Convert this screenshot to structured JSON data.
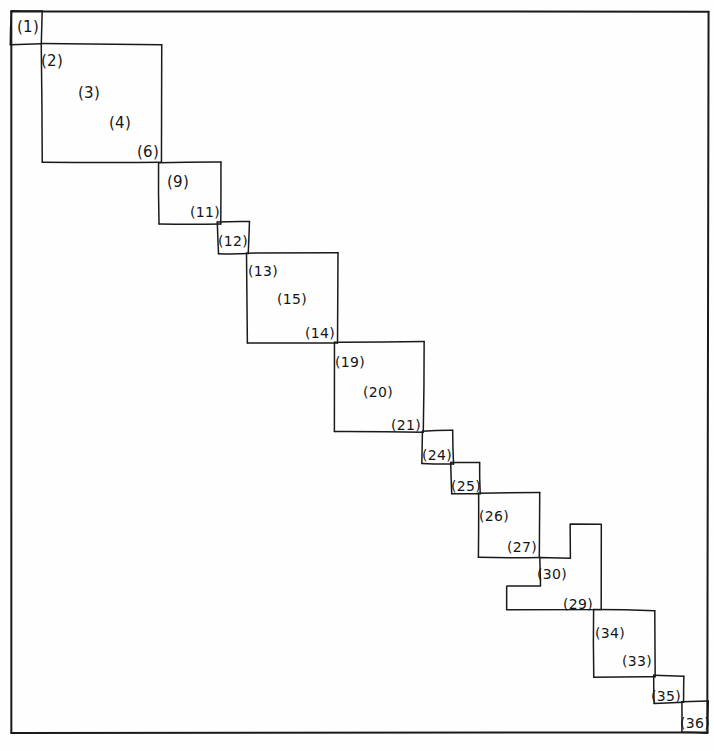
{
  "figure": {
    "stroke_color": "#1a1a1a",
    "background_color": "#fefefe",
    "frame": {
      "x": 11,
      "y": 11,
      "width": 697,
      "height": 722
    },
    "labels": [
      {
        "id": "1",
        "text": "(1)",
        "x": 28,
        "y": 27
      },
      {
        "id": "2",
        "text": "(2)",
        "x": 52,
        "y": 61
      },
      {
        "id": "3",
        "text": "(3)",
        "x": 89,
        "y": 93
      },
      {
        "id": "4",
        "text": "(4)",
        "x": 120,
        "y": 123
      },
      {
        "id": "6",
        "text": "(6)",
        "x": 148,
        "y": 152
      },
      {
        "id": "9",
        "text": "(9)",
        "x": 178,
        "y": 182
      },
      {
        "id": "11",
        "text": "(11)",
        "x": 205,
        "y": 212
      },
      {
        "id": "12",
        "text": "(12)",
        "x": 233,
        "y": 241
      },
      {
        "id": "13",
        "text": "(13)",
        "x": 263,
        "y": 271
      },
      {
        "id": "15",
        "text": "(15)",
        "x": 292,
        "y": 299
      },
      {
        "id": "14",
        "text": "(14)",
        "x": 320,
        "y": 333
      },
      {
        "id": "19",
        "text": "(19)",
        "x": 350,
        "y": 362
      },
      {
        "id": "20",
        "text": "(20)",
        "x": 378,
        "y": 392
      },
      {
        "id": "21",
        "text": "(21)",
        "x": 406,
        "y": 425
      },
      {
        "id": "24",
        "text": "(24)",
        "x": 437,
        "y": 455
      },
      {
        "id": "25",
        "text": "(25)",
        "x": 466,
        "y": 486
      },
      {
        "id": "26",
        "text": "(26)",
        "x": 494,
        "y": 516
      },
      {
        "id": "27",
        "text": "(27)",
        "x": 522,
        "y": 547
      },
      {
        "id": "30",
        "text": "(30)",
        "x": 552,
        "y": 574
      },
      {
        "id": "29",
        "text": "(29)",
        "x": 578,
        "y": 604
      },
      {
        "id": "34",
        "text": "(34)",
        "x": 610,
        "y": 633
      },
      {
        "id": "33",
        "text": "(33)",
        "x": 637,
        "y": 661
      },
      {
        "id": "35",
        "text": "(35)",
        "x": 666,
        "y": 696
      },
      {
        "id": "36",
        "text": "(36)",
        "x": 695,
        "y": 723
      }
    ],
    "blocks": [
      {
        "name": "block-1",
        "x": 11,
        "y": 11,
        "width": 31,
        "height": 33
      },
      {
        "name": "block-2",
        "x": 42,
        "y": 44,
        "width": 119,
        "height": 118
      },
      {
        "name": "block-9",
        "x": 159,
        "y": 162,
        "width": 62,
        "height": 62
      },
      {
        "name": "block-12",
        "x": 218,
        "y": 222,
        "width": 31,
        "height": 32
      },
      {
        "name": "block-13",
        "x": 247,
        "y": 253,
        "width": 91,
        "height": 90
      },
      {
        "name": "block-19",
        "x": 334,
        "y": 342,
        "width": 90,
        "height": 90
      },
      {
        "name": "block-24",
        "x": 422,
        "y": 431,
        "width": 31,
        "height": 33
      },
      {
        "name": "block-25",
        "x": 451,
        "y": 463,
        "width": 29,
        "height": 31
      },
      {
        "name": "block-26",
        "x": 478,
        "y": 493,
        "width": 62,
        "height": 65
      },
      {
        "name": "block-34",
        "x": 594,
        "y": 610,
        "width": 61,
        "height": 67
      },
      {
        "name": "block-35",
        "x": 654,
        "y": 676,
        "width": 30,
        "height": 27
      },
      {
        "name": "block-36",
        "x": 682,
        "y": 701,
        "width": 26,
        "height": 32
      }
    ],
    "staircase_notch": {
      "name": "block-30-29-notch",
      "points": "507,586 507,610 601,610 601,524 570,524 570,558 540,558 540,586 507,586"
    }
  }
}
